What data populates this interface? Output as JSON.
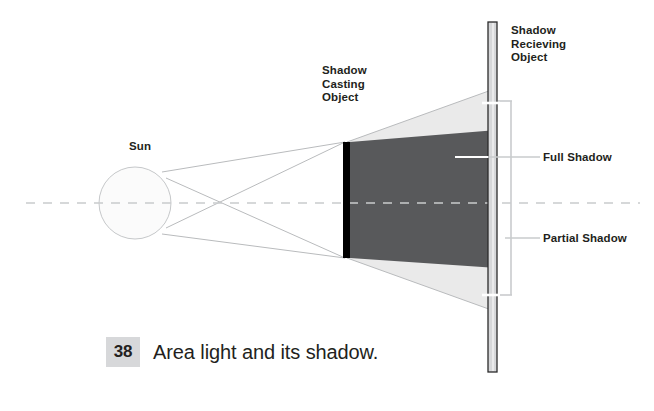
{
  "figure": {
    "title": "Area light and its shadow.",
    "caption_number": "38",
    "caption_text": "Area light and its shadow.",
    "background_color": "#ffffff"
  },
  "labels": {
    "sun": "Sun",
    "shadow_casting_object": "Shadow\nCasting\nObject",
    "shadow_receiving_object": "Shadow\nRecieving\nObject",
    "full_shadow": "Full Shadow",
    "partial_shadow": "Partial Shadow"
  },
  "colors": {
    "umbra": "#58595b",
    "penumbra": "#eaeaea",
    "casting_object": "#000000",
    "receiving_object_fill": "#d6d7d9",
    "receiving_object_stroke": "#2b2b2b",
    "ray_line": "#b9bbbd",
    "sun_fill": "#fbfbfb",
    "sun_stroke": "#c6c8ca",
    "axis_dash": "#c9cbcd",
    "leader_line": "#c9cbcd",
    "caption_number_bg": "#d7d8da",
    "text": "#231f20"
  },
  "geometry": {
    "sun": {
      "cx": 135,
      "cy": 203,
      "r": 36
    },
    "axis": {
      "x1": 26,
      "x2": 640,
      "y": 203
    },
    "ray_crossing_point": {
      "x": 230,
      "y": 203
    },
    "casting_object": {
      "x": 343,
      "y_top": 142,
      "y_bottom": 258,
      "width": 7
    },
    "receiving_object": {
      "x": 488,
      "y_top": 22,
      "y_bottom": 372,
      "width": 9
    },
    "umbra": {
      "left_top": 142,
      "left_bottom": 258,
      "right_top": 130,
      "right_bottom": 268
    },
    "penumbra": {
      "left_top": 142,
      "left_bottom": 258,
      "right_top": 88,
      "right_bottom": 312
    },
    "bracket": {
      "x_bar": 510,
      "y_top": 101,
      "y_bottom": 295,
      "tick_len": 18
    },
    "leaders": {
      "full_shadow": {
        "x1": 455,
        "x2": 540,
        "y": 157
      },
      "partial_shadow": {
        "x1": 505,
        "x2": 540,
        "y": 238
      }
    }
  }
}
